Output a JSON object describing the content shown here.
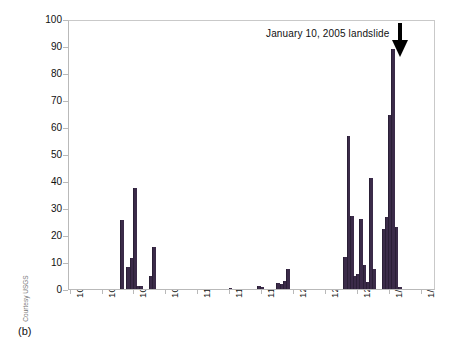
{
  "figure": {
    "panel_label": "(b)",
    "credit": "Courtesy USGS",
    "bar_color": "#3b2b49",
    "axis_color": "#b9b9b9"
  },
  "annotation": {
    "text": "January 10, 2005 landslide",
    "arrow_icon": "down-arrow-icon"
  },
  "chart_data": {
    "type": "bar",
    "title": "",
    "xlabel": "",
    "ylabel": "Rainfall (millimeters)",
    "ylim": [
      0,
      100
    ],
    "ytick_labels": [
      "0",
      "10",
      "20",
      "30",
      "40",
      "50",
      "60",
      "70",
      "80",
      "90",
      "100"
    ],
    "ytick_values": [
      0,
      10,
      20,
      30,
      40,
      50,
      60,
      70,
      80,
      90,
      100
    ],
    "xtick_labels": [
      "10/1/04",
      "10/11/04",
      "10/21/04",
      "10/31/04",
      "11/10/04",
      "11/20/04",
      "11/30/04",
      "12/10/04",
      "12/20/04",
      "12/30/04",
      "1/9/05",
      "1/19/05"
    ],
    "x_range": [
      "10/1/04",
      "1/24/05"
    ],
    "grid": false,
    "legend": "none",
    "annotations": [
      {
        "text": "January 10, 2005 landslide",
        "x": "1/10/05",
        "y": 100,
        "arrow": "down"
      }
    ],
    "categories": [
      "10/1/04",
      "10/2/04",
      "10/3/04",
      "10/4/04",
      "10/5/04",
      "10/6/04",
      "10/7/04",
      "10/8/04",
      "10/9/04",
      "10/10/04",
      "10/11/04",
      "10/12/04",
      "10/13/04",
      "10/14/04",
      "10/15/04",
      "10/16/04",
      "10/17/04",
      "10/18/04",
      "10/19/04",
      "10/20/04",
      "10/21/04",
      "10/22/04",
      "10/23/04",
      "10/24/04",
      "10/25/04",
      "10/26/04",
      "10/27/04",
      "10/28/04",
      "10/29/04",
      "10/30/04",
      "10/31/04",
      "11/1/04",
      "11/2/04",
      "11/3/04",
      "11/4/04",
      "11/5/04",
      "11/6/04",
      "11/7/04",
      "11/8/04",
      "11/9/04",
      "11/10/04",
      "11/11/04",
      "11/12/04",
      "11/13/04",
      "11/14/04",
      "11/15/04",
      "11/16/04",
      "11/17/04",
      "11/18/04",
      "11/19/04",
      "11/20/04",
      "11/21/04",
      "11/22/04",
      "11/23/04",
      "11/24/04",
      "11/25/04",
      "11/26/04",
      "11/27/04",
      "11/28/04",
      "11/29/04",
      "11/30/04",
      "12/1/04",
      "12/2/04",
      "12/3/04",
      "12/4/04",
      "12/5/04",
      "12/6/04",
      "12/7/04",
      "12/8/04",
      "12/9/04",
      "12/10/04",
      "12/11/04",
      "12/12/04",
      "12/13/04",
      "12/14/04",
      "12/15/04",
      "12/16/04",
      "12/17/04",
      "12/18/04",
      "12/19/04",
      "12/20/04",
      "12/21/04",
      "12/22/04",
      "12/23/04",
      "12/24/04",
      "12/25/04",
      "12/26/04",
      "12/27/04",
      "12/28/04",
      "12/29/04",
      "12/30/04",
      "12/31/04",
      "1/1/05",
      "1/2/05",
      "1/3/05",
      "1/4/05",
      "1/5/05",
      "1/6/05",
      "1/7/05",
      "1/8/05",
      "1/9/05",
      "1/10/05",
      "1/11/05",
      "1/12/05",
      "1/13/05",
      "1/14/05",
      "1/15/05",
      "1/16/05",
      "1/17/05",
      "1/18/05",
      "1/19/05",
      "1/20/05",
      "1/21/05",
      "1/22/05",
      "1/23/05"
    ],
    "values": [
      0,
      0,
      0,
      0,
      0,
      0,
      0,
      0,
      0,
      0,
      0,
      0,
      0,
      0,
      0,
      0,
      25.5,
      0,
      8,
      11.5,
      37.5,
      1,
      1,
      0,
      0,
      4.8,
      15.5,
      0,
      0,
      0,
      0,
      0,
      0,
      0,
      0,
      0,
      0,
      0,
      0,
      0,
      0,
      0,
      0,
      0,
      0,
      0,
      0,
      0,
      0,
      0,
      0.3,
      0,
      0,
      0,
      0,
      0,
      0,
      0,
      0,
      1,
      0.8,
      0,
      0,
      0,
      0,
      2.3,
      2,
      3,
      7.5,
      0,
      0,
      0,
      0,
      0,
      0,
      0,
      0,
      0,
      0,
      0,
      0,
      0,
      0,
      0,
      0,
      0,
      12,
      56.5,
      27.2,
      5,
      5.5,
      26,
      9,
      2.5,
      41,
      7.3,
      0,
      0,
      22.2,
      26.8,
      64.5,
      89,
      23,
      0.8,
      0,
      0,
      0,
      0,
      0,
      0,
      0,
      0,
      0,
      0,
      0
    ],
    "notable_peaks": [
      {
        "date": "10/17/04",
        "value": 25.5
      },
      {
        "date": "10/21/04",
        "value": 37.5
      },
      {
        "date": "10/27/04",
        "value": 15.5
      },
      {
        "date": "12/27/04",
        "value": 56.5
      },
      {
        "date": "1/3/05",
        "value": 41
      },
      {
        "date": "1/9/05",
        "value": 64.5
      },
      {
        "date": "1/10/05",
        "value": 89
      }
    ]
  }
}
